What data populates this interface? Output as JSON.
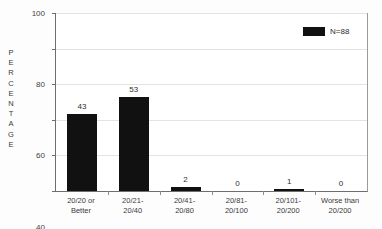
{
  "chart_data": {
    "type": "bar",
    "title": "",
    "subtitle": "",
    "xlabel": "",
    "ylabel": "PERCENTAGE",
    "ylim": [
      0,
      100
    ],
    "yticks": [
      0,
      20,
      40,
      60,
      80,
      100
    ],
    "ytick_labels": [
      "0",
      "20",
      "40",
      "60",
      "80",
      "100"
    ],
    "grid": true,
    "grid_axis": "y",
    "legend": {
      "position": "top-right",
      "entries": [
        {
          "label": "N=88",
          "color": "#111111",
          "marker": "square"
        }
      ]
    },
    "categories": [
      "20/20 or Better",
      "20/21-20/40",
      "20/41-20/80",
      "20/81-20/100",
      "20/101-20/200",
      "Worse than 20/200"
    ],
    "category_lines": [
      [
        "20/20 or",
        "Better"
      ],
      [
        "20/21-",
        "20/40"
      ],
      [
        "20/41-",
        "20/80"
      ],
      [
        "20/81-",
        "20/100"
      ],
      [
        "20/101-",
        "20/200"
      ],
      [
        "Worse than",
        "20/200"
      ]
    ],
    "values": [
      43,
      53,
      2,
      0,
      1,
      0
    ],
    "data_labels": [
      "43",
      "53",
      "2",
      "0",
      "1",
      "0"
    ],
    "series": [
      {
        "name": "N=88",
        "color": "#111111",
        "values": [
          43,
          53,
          2,
          0,
          1,
          0
        ]
      }
    ],
    "colors": {
      "bar": "#111111",
      "axis": "#6e6e6e",
      "grid": "#e3e3e3",
      "text": "#3a3a3a",
      "background": "#ffffff"
    }
  }
}
